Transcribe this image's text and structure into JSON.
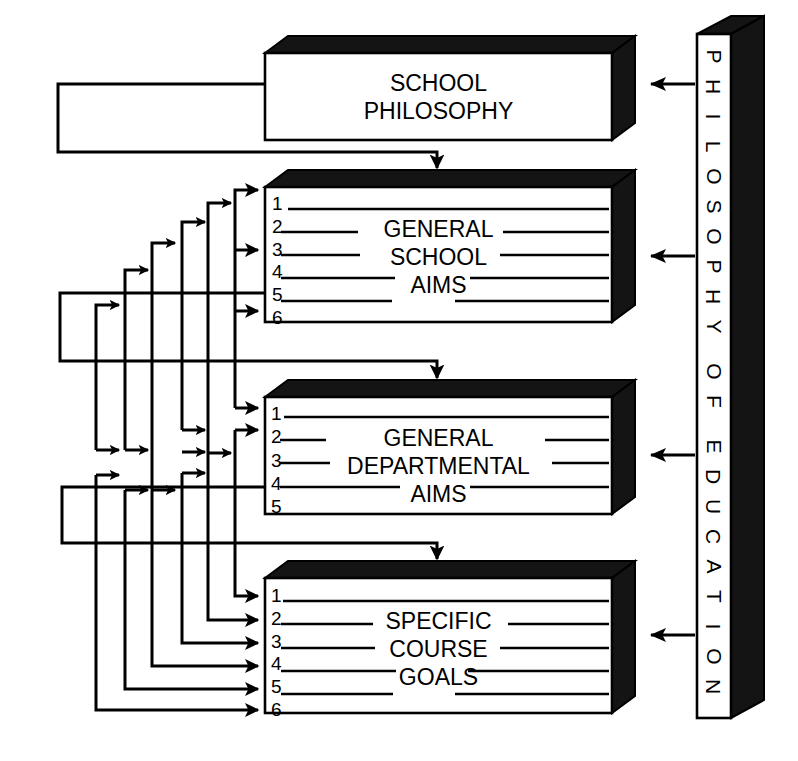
{
  "diagram": {
    "colors": {
      "ink": "#000000",
      "paper": "#ffffff",
      "shadow": "#1a1a1a"
    },
    "source_bar": {
      "name": "philosophy-of-education-bar",
      "text": "PHILOSOPHY OF EDUCATION",
      "letters": [
        "P",
        "H",
        "I",
        "L",
        "O",
        "S",
        "O",
        "P",
        "H",
        "Y",
        "O",
        "F",
        "E",
        "D",
        "U",
        "C",
        "A",
        "T",
        "I",
        "O",
        "N"
      ],
      "word_breaks_after": [
        9,
        11
      ]
    },
    "boxes": [
      {
        "id": "school-philosophy",
        "title_lines": [
          "SCHOOL",
          "PHILOSOPHY"
        ],
        "numbers": []
      },
      {
        "id": "general-school-aims",
        "title_lines": [
          "GENERAL",
          "SCHOOL",
          "AIMS"
        ],
        "numbers": [
          "1",
          "2",
          "3",
          "4",
          "5",
          "6"
        ]
      },
      {
        "id": "general-departmental-aims",
        "title_lines": [
          "GENERAL",
          "DEPARTMENTAL",
          "AIMS"
        ],
        "numbers": [
          "1",
          "2",
          "3",
          "4",
          "5"
        ]
      },
      {
        "id": "specific-course-goals",
        "title_lines": [
          "SPECIFIC",
          "COURSE",
          "GOALS"
        ],
        "numbers": [
          "1",
          "2",
          "3",
          "4",
          "5",
          "6"
        ]
      }
    ],
    "connections": {
      "from_philosophy_bar": [
        {
          "to": "school-philosophy",
          "direction": "left"
        },
        {
          "to": "general-school-aims",
          "direction": "left"
        },
        {
          "to": "general-departmental-aims",
          "direction": "left"
        },
        {
          "to": "specific-course-goals",
          "direction": "left"
        }
      ],
      "top_down_feeds": [
        {
          "from": "school-philosophy",
          "to": "general-school-aims",
          "direction": "down"
        },
        {
          "from": "general-school-aims",
          "to": "general-departmental-aims",
          "direction": "down"
        },
        {
          "from": "general-departmental-aims",
          "to": "specific-course-goals",
          "direction": "down"
        }
      ],
      "feedback_arrow_counts": {
        "into-general-school-aims": 3,
        "into-general-departmental-aims": 6,
        "into-specific-course-goals": 6
      }
    }
  }
}
